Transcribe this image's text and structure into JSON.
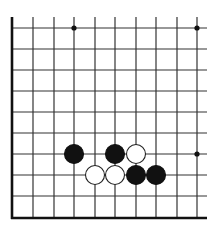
{
  "diagram": {
    "type": "go-board-fragment",
    "colors": {
      "background": "#ffffff",
      "line": "#333333",
      "edge": "#111111",
      "black_stone": "#111111",
      "white_stone": "#ffffff",
      "white_stone_outline": "#222222",
      "star_point": "#111111"
    },
    "grid": {
      "x": [
        12,
        33,
        54,
        74,
        95,
        115,
        136,
        156,
        177,
        197
      ],
      "y": [
        28,
        49,
        70,
        91,
        112,
        133,
        154,
        175,
        196
      ],
      "top_extent": 17,
      "right_extent": 207,
      "bottom_edge_y": 218,
      "left_edge_x": 12
    },
    "edges": [
      "left",
      "bottom"
    ],
    "star_points": [
      {
        "col": 3,
        "row": 0
      },
      {
        "col": 9,
        "row": 0
      },
      {
        "col": 9,
        "row": 6
      }
    ],
    "stones": [
      {
        "color": "black",
        "col": 3,
        "row": 6
      },
      {
        "color": "black",
        "col": 5,
        "row": 6
      },
      {
        "color": "white",
        "col": 6,
        "row": 6
      },
      {
        "color": "white",
        "col": 4,
        "row": 7
      },
      {
        "color": "white",
        "col": 5,
        "row": 7
      },
      {
        "color": "black",
        "col": 6,
        "row": 7
      },
      {
        "color": "black",
        "col": 7,
        "row": 7
      }
    ],
    "stone_radius": 9.5
  }
}
